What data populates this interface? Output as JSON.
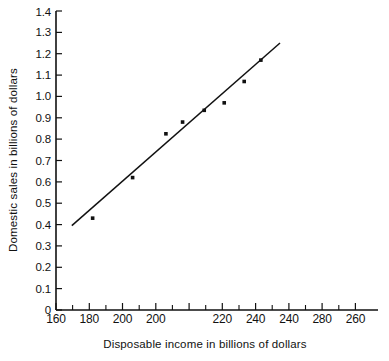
{
  "chart_data": {
    "type": "scatter",
    "title": "",
    "xlabel": "Disposable income in billions of dollars",
    "ylabel": "Domestic sales in billions of dollars",
    "xlim": [
      160,
      310
    ],
    "ylim": [
      0,
      1.4
    ],
    "grid": false,
    "legend": null,
    "x_major_ticks": [
      160,
      180,
      200,
      220,
      240,
      260,
      280,
      300
    ],
    "x_minor_ticks": [
      170,
      190,
      210,
      230,
      250,
      270,
      290
    ],
    "x_tick_labels": [
      "160",
      "180",
      "200",
      "220",
      "240",
      "260",
      "280",
      "300"
    ],
    "y_major_ticks": [
      0,
      0.1,
      0.2,
      0.3,
      0.4,
      0.5,
      0.6,
      0.7,
      0.8,
      0.9,
      1.0,
      1.1,
      1.2,
      1.3,
      1.4
    ],
    "y_tick_labels": [
      "0",
      "0.1",
      "0.2",
      "0.3",
      "0.4",
      "0.5",
      "0.6",
      "0.7",
      "0.8",
      "0.9",
      "1.0",
      "1.1",
      "1.2",
      "1.3",
      "1.4"
    ],
    "x": [
      182,
      206,
      226,
      236,
      249,
      261,
      273,
      283
    ],
    "y": [
      0.43,
      0.62,
      0.825,
      0.88,
      0.935,
      0.97,
      1.07,
      1.17
    ],
    "points": [
      {
        "x": 182,
        "y": 0.43
      },
      {
        "x": 206,
        "y": 0.62
      },
      {
        "x": 226,
        "y": 0.825
      },
      {
        "x": 236,
        "y": 0.88
      },
      {
        "x": 249,
        "y": 0.935
      },
      {
        "x": 261,
        "y": 0.97
      },
      {
        "x": 273,
        "y": 1.07
      },
      {
        "x": 283,
        "y": 1.17
      }
    ],
    "series": [
      {
        "name": "Domestic sales vs disposable income",
        "x": [
          182,
          206,
          226,
          236,
          249,
          261,
          273,
          283
        ],
        "values": [
          0.43,
          0.62,
          0.825,
          0.88,
          0.935,
          0.97,
          1.07,
          1.17
        ]
      }
    ],
    "trend_line": {
      "type": "linear-fit",
      "x_start": 169.5,
      "y_start": 0.395,
      "x_end": 294.5,
      "y_end": 1.25,
      "slope": 0.00684,
      "intercept": -0.764
    },
    "colors": {
      "axis": "#111111",
      "marker": "#111111",
      "line": "#111111",
      "background": "#ffffff"
    }
  }
}
